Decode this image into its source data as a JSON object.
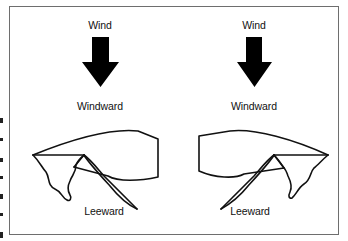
{
  "figure": {
    "colors": {
      "stroke": "#111111",
      "arrow_fill": "#000000",
      "frame_border": "#6e6e6e",
      "background": "#ffffff"
    },
    "panels": [
      {
        "id": "left",
        "wind_label": "Wind",
        "arrow_icon": "down-arrow",
        "windward_label": "Windward",
        "leeward_label": "Leeward",
        "sail_orientation": "luff-left"
      },
      {
        "id": "right",
        "wind_label": "Wind",
        "arrow_icon": "down-arrow",
        "windward_label": "Windward",
        "leeward_label": "Leeward",
        "sail_orientation": "luff-right"
      }
    ]
  }
}
